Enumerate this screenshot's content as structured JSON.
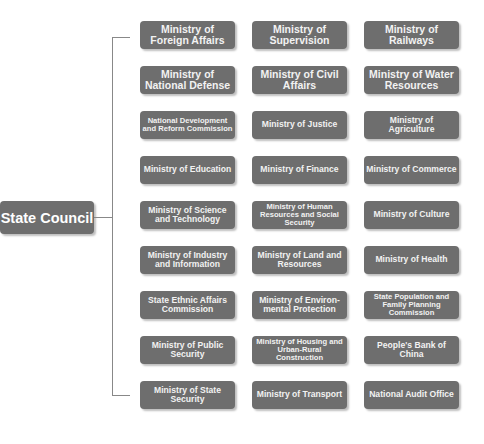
{
  "root": {
    "label": "State Council"
  },
  "colors": {
    "box_fill": "#6e6e6e",
    "text": "#ffffff",
    "connector": "#888888",
    "background": "#ffffff"
  },
  "rows": [
    {
      "y": 21,
      "items": [
        {
          "label": "Ministry of Foreign Affairs",
          "size": "l"
        },
        {
          "label": "Ministry of Supervision",
          "size": "l"
        },
        {
          "label": "Ministry of Railways",
          "size": "l"
        }
      ]
    },
    {
      "y": 66,
      "items": [
        {
          "label": "Ministry of National Defense",
          "size": "l"
        },
        {
          "label": "Ministry of Civil Affairs",
          "size": "l"
        },
        {
          "label": "Ministry of Water Resources",
          "size": "l"
        }
      ]
    },
    {
      "y": 111,
      "items": [
        {
          "label": "National Development and Reform Commission",
          "size": "s"
        },
        {
          "label": "Ministry of Justice",
          "size": "m"
        },
        {
          "label": "Ministry of Agriculture",
          "size": "m"
        }
      ]
    },
    {
      "y": 156,
      "items": [
        {
          "label": "Ministry of Education",
          "size": "m"
        },
        {
          "label": "Ministry of Finance",
          "size": "m"
        },
        {
          "label": "Ministry of Commerce",
          "size": "m"
        }
      ]
    },
    {
      "y": 201,
      "items": [
        {
          "label": "Ministry of Science and Technology",
          "size": "m"
        },
        {
          "label": "Ministry of Human Resources and Social Security",
          "size": "s"
        },
        {
          "label": "Ministry of Culture",
          "size": "m"
        }
      ]
    },
    {
      "y": 246,
      "items": [
        {
          "label": "Ministry of Industry and Information",
          "size": "m"
        },
        {
          "label": "Ministry of Land and Resources",
          "size": "m"
        },
        {
          "label": "Ministry of Health",
          "size": "m"
        }
      ]
    },
    {
      "y": 291,
      "items": [
        {
          "label": "State Ethnic Affairs Commission",
          "size": "m"
        },
        {
          "label": "Ministry of Environ-mental Protection",
          "size": "m"
        },
        {
          "label": "State Population and Family Planning Commission",
          "size": "s"
        }
      ]
    },
    {
      "y": 336,
      "items": [
        {
          "label": "Ministry of Public Security",
          "size": "m"
        },
        {
          "label": "Ministry of Housing and Urban-Rural Construction",
          "size": "s"
        },
        {
          "label": "People's Bank of China",
          "size": "m"
        }
      ]
    },
    {
      "y": 381,
      "items": [
        {
          "label": "Ministry of State Security",
          "size": "m"
        },
        {
          "label": "Ministry of Transport",
          "size": "m"
        },
        {
          "label": "National Audit Office",
          "size": "m"
        }
      ]
    }
  ]
}
